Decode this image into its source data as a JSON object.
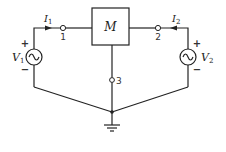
{
  "diagram": {
    "type": "circuit",
    "block": {
      "label": "M",
      "label_style": "script"
    },
    "sources": [
      {
        "id": "V1",
        "label": "V",
        "subscript": "1",
        "type": "ac",
        "plus": "+",
        "minus": "−"
      },
      {
        "id": "V2",
        "label": "V",
        "subscript": "2",
        "type": "ac",
        "plus": "+",
        "minus": "−"
      }
    ],
    "currents": [
      {
        "id": "I1",
        "label": "I",
        "subscript": "1",
        "direction": "right"
      },
      {
        "id": "I2",
        "label": "I",
        "subscript": "2",
        "direction": "left"
      }
    ],
    "nodes": [
      {
        "id": "1",
        "label": "1"
      },
      {
        "id": "2",
        "label": "2"
      },
      {
        "id": "3",
        "label": "3"
      }
    ],
    "ground": {
      "symbol": "ground"
    },
    "colors": {
      "stroke": "#222222",
      "background": "#ffffff"
    }
  }
}
